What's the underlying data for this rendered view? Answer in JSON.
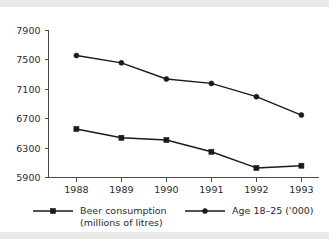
{
  "chart_data": {
    "type": "line",
    "title": "",
    "subtitle": "",
    "xlabel": "",
    "ylabel": "",
    "categories": [
      "1988",
      "1989",
      "1990",
      "1991",
      "1992",
      "1993"
    ],
    "ylim": [
      5900,
      7900
    ],
    "yticks": [
      5900,
      6300,
      6700,
      7100,
      7500,
      7900
    ],
    "ytick_labels": [
      "5900",
      "6300",
      "6700",
      "7100",
      "7500",
      "7900"
    ],
    "grid": false,
    "legend_position": "bottom",
    "series": [
      {
        "name": "Beer consumption (millions of litres)",
        "legend_label_line1": "Beer consumption",
        "legend_label_line2": "(millions of litres)",
        "marker": "square",
        "color": "#1b1b1b",
        "values": [
          6560,
          6440,
          6410,
          6250,
          6030,
          6060
        ]
      },
      {
        "name": "Age 18-25 ('000)",
        "legend_label_line1": "Age 18–25 ('000)",
        "legend_label_line2": "",
        "marker": "circle",
        "color": "#1b1b1b",
        "values": [
          7560,
          7460,
          7240,
          7180,
          7000,
          6750
        ]
      }
    ]
  },
  "figure": {
    "background_color": "#ffffff",
    "band_color": "#e8e8e6",
    "axis_color": "#4a4a4a",
    "ink_color": "#1b1b1b"
  }
}
